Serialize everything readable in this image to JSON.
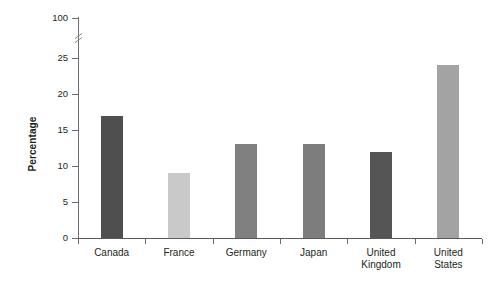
{
  "chart_data": {
    "type": "bar",
    "title": "",
    "subtitle": "",
    "xlabel": "",
    "ylabel": "Percentage",
    "categories": [
      "Canada",
      "France",
      "Germany",
      "Japan",
      "United Kingdom",
      "United States"
    ],
    "values": [
      17,
      9,
      13,
      13,
      12,
      24
    ],
    "series": [
      {
        "name": "Percentage",
        "values": [
          17,
          9,
          13,
          13,
          12,
          24
        ]
      }
    ],
    "bar_colors": [
      "#4f4f4f",
      "#c9c9c9",
      "#808080",
      "#7d7d7d",
      "#555555",
      "#a3a3a3"
    ],
    "ylim": [
      0,
      100
    ],
    "y_ticks": [
      0,
      5,
      10,
      15,
      20,
      25,
      100
    ],
    "y_tick_labels": [
      "0",
      "5",
      "10",
      "15",
      "20",
      "25",
      "100"
    ],
    "axis_break": {
      "present": true,
      "between": [
        25,
        100
      ],
      "style": "diagonal-slash"
    },
    "grid": false,
    "legend": false,
    "legend_position": "none",
    "annotations": []
  },
  "axis": {
    "spine_color": "#6d6e70",
    "baseline_color": "#58595b",
    "tick_color": "#6d6e70",
    "text_color": "#231f20"
  },
  "category_labels": [
    {
      "line1": "Canada",
      "line2": ""
    },
    {
      "line1": "France",
      "line2": ""
    },
    {
      "line1": "Germany",
      "line2": ""
    },
    {
      "line1": "Japan",
      "line2": ""
    },
    {
      "line1": "United",
      "line2": "Kingdom"
    },
    {
      "line1": "United",
      "line2": "States"
    }
  ]
}
